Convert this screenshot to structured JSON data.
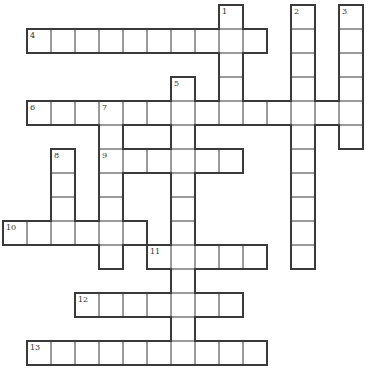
{
  "puzzle": {
    "cell_size": 24,
    "origin_x": 3,
    "origin_y": 5,
    "line_color": "#3a3a3a",
    "inner_line_color": "#9a9a9a",
    "words": [
      {
        "number": "1",
        "direction": "down",
        "row": 0,
        "col": 9,
        "length": 5
      },
      {
        "number": "2",
        "direction": "down",
        "row": 0,
        "col": 12,
        "length": 11
      },
      {
        "number": "3",
        "direction": "down",
        "row": 0,
        "col": 14,
        "length": 6
      },
      {
        "number": "4",
        "direction": "across",
        "row": 1,
        "col": 1,
        "length": 10
      },
      {
        "number": "5",
        "direction": "down",
        "row": 3,
        "col": 7,
        "length": 12
      },
      {
        "number": "6",
        "direction": "across",
        "row": 4,
        "col": 1,
        "length": 14
      },
      {
        "number": "7",
        "direction": "down",
        "row": 4,
        "col": 4,
        "length": 7
      },
      {
        "number": "8",
        "direction": "down",
        "row": 6,
        "col": 2,
        "length": 4
      },
      {
        "number": "9",
        "direction": "across",
        "row": 6,
        "col": 4,
        "length": 6
      },
      {
        "number": "10",
        "direction": "across",
        "row": 9,
        "col": 0,
        "length": 6
      },
      {
        "number": "11",
        "direction": "across",
        "row": 10,
        "col": 6,
        "length": 5
      },
      {
        "number": "12",
        "direction": "across",
        "row": 12,
        "col": 3,
        "length": 7
      },
      {
        "number": "13",
        "direction": "across",
        "row": 14,
        "col": 1,
        "length": 10
      }
    ]
  }
}
